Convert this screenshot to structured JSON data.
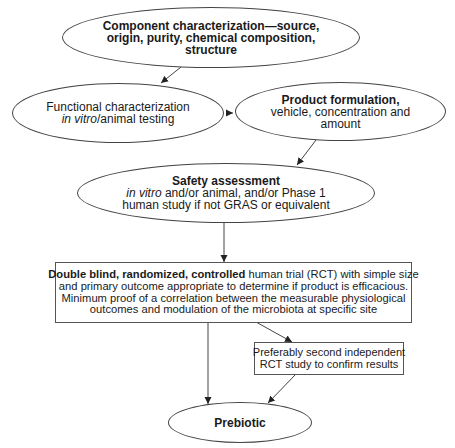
{
  "diagram": {
    "nodes": {
      "component": {
        "shape": "ellipse",
        "lines": [
          "Component characterization—source,",
          "origin, purity, chemical composition,",
          "structure"
        ]
      },
      "functional": {
        "shape": "ellipse",
        "line1": "Functional characterization",
        "line2_italic": "in vitro",
        "line2_rest": "/animal testing"
      },
      "formulation": {
        "shape": "ellipse",
        "title": "Product formulation,",
        "lines": [
          "vehicle, concentration and",
          "amount"
        ]
      },
      "safety": {
        "shape": "ellipse",
        "title": "Safety assessment",
        "line2_italic": "in vitro",
        "line2_rest": " and/or animal, and/or Phase 1",
        "line3": "human study if not GRAS or equivalent"
      },
      "rct": {
        "shape": "box",
        "line1_bold": "Double blind, randomized, controlled",
        "line1_rest": " human trial (RCT) with simple size",
        "lines": [
          "and primary outcome appropriate to determine if product is efficacious.",
          "Minimum proof of a correlation between the measurable physiological",
          "outcomes and modulation of the microbiota at specific site"
        ]
      },
      "second_rct": {
        "shape": "box",
        "lines": [
          "Preferably second independent",
          "RCT study to confirm results"
        ]
      },
      "prebiotic": {
        "shape": "ellipse",
        "label": "Prebiotic"
      }
    },
    "edges": [
      {
        "from": "component",
        "to": "functional"
      },
      {
        "from": "functional",
        "to": "formulation"
      },
      {
        "from": "formulation",
        "to": "safety"
      },
      {
        "from": "safety",
        "to": "rct"
      },
      {
        "from": "rct",
        "to": "second_rct"
      },
      {
        "from": "rct",
        "to": "prebiotic"
      },
      {
        "from": "second_rct",
        "to": "prebiotic"
      }
    ],
    "colors": {
      "stroke": "#444444",
      "text": "#1a1a1a",
      "background": "#ffffff"
    }
  }
}
